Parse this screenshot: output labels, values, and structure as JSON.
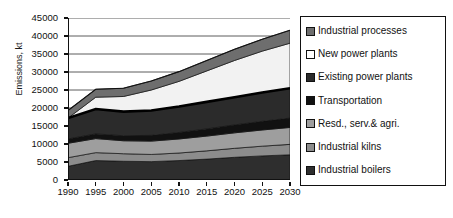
{
  "chart_data": {
    "type": "area",
    "title": "",
    "xlabel": "",
    "ylabel": "Emissions, kt",
    "stacked": true,
    "grid": true,
    "legend_position": "right",
    "x": [
      1990,
      1995,
      2000,
      2005,
      2010,
      2015,
      2020,
      2025,
      2030
    ],
    "xlim": [
      1990,
      2030
    ],
    "ylim": [
      0,
      45000
    ],
    "ytick_labels": [
      "0",
      "5000",
      "10000",
      "15000",
      "20000",
      "25000",
      "30000",
      "35000",
      "40000",
      "45000"
    ],
    "ytick_values": [
      0,
      5000,
      10000,
      15000,
      20000,
      25000,
      30000,
      35000,
      40000,
      45000
    ],
    "xtick_labels": [
      "1990",
      "1995",
      "2000",
      "2005",
      "2010",
      "2015",
      "2020",
      "2025",
      "2030"
    ],
    "series": [
      {
        "name": "Industrial boilers",
        "color": "#2e2e2e",
        "values": [
          3800,
          5400,
          5200,
          5100,
          5400,
          5800,
          6300,
          6700,
          7000
        ]
      },
      {
        "name": "Industrial kilns",
        "color": "#8c8c8c",
        "values": [
          2400,
          2200,
          2100,
          2000,
          2100,
          2300,
          2500,
          2700,
          2900
        ]
      },
      {
        "name": "Resd., serv.& agri.",
        "color": "#9e9e9e",
        "values": [
          4000,
          3900,
          3600,
          3700,
          3900,
          4100,
          4300,
          4500,
          4700
        ]
      },
      {
        "name": "Transportation",
        "color": "#111111",
        "values": [
          1200,
          1300,
          1400,
          1600,
          1800,
          2000,
          2200,
          2400,
          2600
        ]
      },
      {
        "name": "Existing power plants",
        "color": "#2b2b2b",
        "values": [
          5800,
          6900,
          6700,
          6900,
          7200,
          7500,
          7700,
          8000,
          8300
        ]
      },
      {
        "name": "New power plants",
        "color": "#f2f2f2",
        "values": [
          0,
          3300,
          4200,
          5700,
          7000,
          8600,
          10200,
          11500,
          12500
        ]
      },
      {
        "name": "Industrial processes",
        "color": "#6e6e6e",
        "values": [
          2100,
          2200,
          2300,
          2500,
          2700,
          2900,
          3100,
          3300,
          3600
        ]
      }
    ],
    "totals": [
      19300,
      25200,
      25500,
      27500,
      30100,
      33200,
      36300,
      39100,
      41600
    ],
    "annotations": [
      {
        "text": "thick black boundary line at top of Existing power plants",
        "type": "line"
      }
    ]
  },
  "legend": {
    "items": [
      {
        "label": "Industrial processes",
        "color": "#6e6e6e"
      },
      {
        "label": "New power plants",
        "color": "#ffffff"
      },
      {
        "label": "Existing power plants",
        "color": "#2b2b2b"
      },
      {
        "label": "Transportation",
        "color": "#111111"
      },
      {
        "label": "Resd., serv.& agri.",
        "color": "#9e9e9e"
      },
      {
        "label": "Industrial kilns",
        "color": "#8c8c8c"
      },
      {
        "label": "Industrial boilers",
        "color": "#2e2e2e"
      }
    ]
  }
}
